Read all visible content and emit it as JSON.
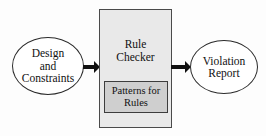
{
  "diagram": {
    "type": "flow-diagram",
    "background_color": "#fdfdfd",
    "input_node": {
      "shape": "ellipse",
      "fill_color": "#ffffff",
      "lines": [
        "Design",
        "and",
        "Constraints"
      ]
    },
    "process_node": {
      "shape": "rectangle",
      "fill_color": "#e9e9e9",
      "lines": [
        "Rule",
        "Checker"
      ],
      "subsystem": {
        "shape": "rectangle",
        "fill_color": "#cfcfcf",
        "lines": [
          "Patterns for",
          "Rules"
        ]
      }
    },
    "output_node": {
      "shape": "ellipse",
      "fill_color": "#ffffff",
      "lines": [
        "Violation",
        "Report"
      ]
    },
    "connectors": [
      {
        "name": "input-to-process",
        "direction": "right",
        "color": "#111111"
      },
      {
        "name": "process-to-output",
        "direction": "right",
        "color": "#111111"
      }
    ]
  }
}
